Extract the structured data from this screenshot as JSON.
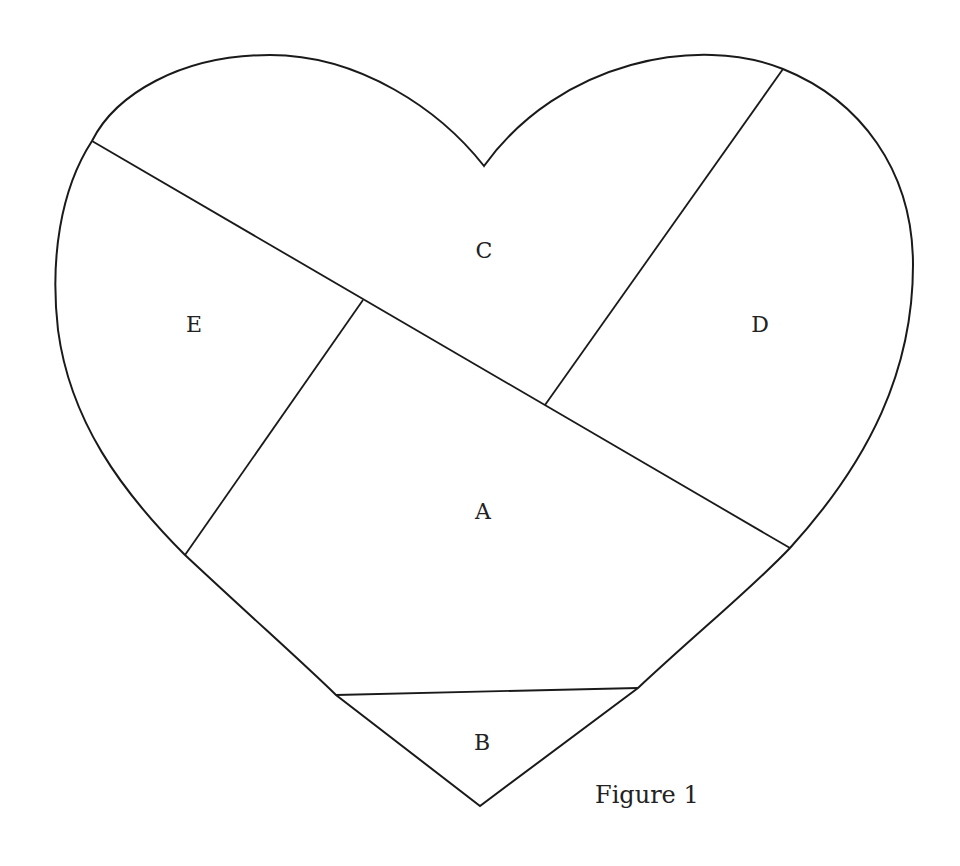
{
  "figure": {
    "caption": "Figure 1",
    "shape": "heart",
    "regions": [
      {
        "id": "A",
        "label": "A",
        "x": 483,
        "y": 512
      },
      {
        "id": "B",
        "label": "B",
        "x": 482,
        "y": 743
      },
      {
        "id": "C",
        "label": "C",
        "x": 484,
        "y": 251
      },
      {
        "id": "D",
        "label": "D",
        "x": 760,
        "y": 325
      },
      {
        "id": "E",
        "label": "E",
        "x": 194,
        "y": 325
      }
    ],
    "dividers": [
      {
        "name": "diagonal-line-c-boundary",
        "from": [
          92,
          141
        ],
        "to": [
          790,
          548
        ]
      },
      {
        "name": "line-d-boundary",
        "from": [
          783,
          69
        ],
        "to": [
          545,
          405
        ]
      },
      {
        "name": "line-e-boundary",
        "from": [
          363,
          300
        ],
        "to": [
          185,
          555
        ]
      },
      {
        "name": "line-b-boundary",
        "from": [
          336,
          695
        ],
        "to": [
          638,
          688
        ]
      }
    ],
    "colors": {
      "stroke": "#1a1a1a",
      "background": "#ffffff",
      "text": "#222222"
    }
  }
}
